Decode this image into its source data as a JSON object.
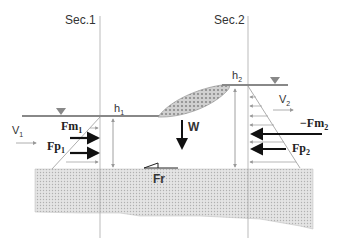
{
  "diagram": {
    "type": "hydraulic-jump-free-body",
    "sections": [
      {
        "label": "Sec.1",
        "x": 100
      },
      {
        "label": "Sec.2",
        "x": 248
      }
    ],
    "depths": [
      {
        "label": "h",
        "sub": "1"
      },
      {
        "label": "h",
        "sub": "2"
      }
    ],
    "velocities": [
      {
        "label": "V",
        "sub": "1"
      },
      {
        "label": "V",
        "sub": "2"
      }
    ],
    "forces": {
      "fm1": {
        "label": "Fm",
        "sub": "1"
      },
      "fp1": {
        "label": "Fp",
        "sub": "1"
      },
      "fm2": {
        "label": "−Fm",
        "sub": "2"
      },
      "fp2": {
        "label": "Fp",
        "sub": "2"
      },
      "weight": {
        "label": "W"
      },
      "friction": {
        "label": "Fr"
      }
    },
    "colors": {
      "line": "#888888",
      "arrow": "#111111",
      "ground_fill": "#d9d9d9",
      "roller_fill": "#bbbbbb"
    }
  }
}
